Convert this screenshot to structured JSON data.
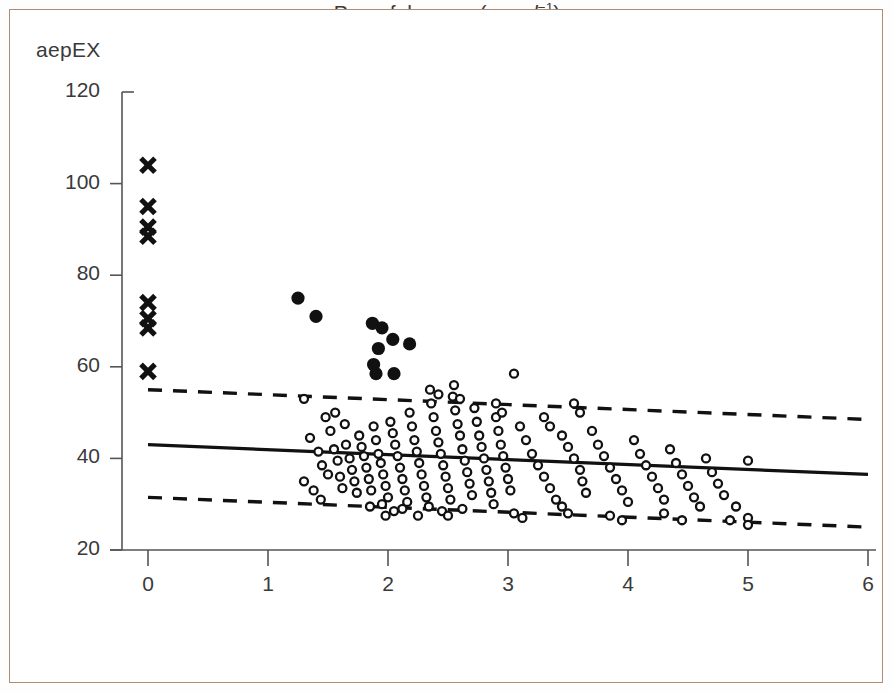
{
  "figure": {
    "border_color": "#b08b72",
    "background": "#ffffff",
    "ink_color": "#111111",
    "axis_color": "#555555"
  },
  "chart_data": {
    "type": "scatter",
    "title": "",
    "ylabel": "aepEX",
    "xlabel_prefix": "Propofol concn (",
    "xlabel_mu": "μg ml",
    "xlabel_sup": "−1",
    "xlabel_suffix": ")",
    "xlabel_plain": "Propofol concn (μg ml−1)",
    "xlim": [
      0,
      6
    ],
    "ylim": [
      20,
      120
    ],
    "xticks": [
      0,
      1,
      2,
      3,
      4,
      5,
      6
    ],
    "yticks": [
      20,
      40,
      60,
      80,
      100,
      120
    ],
    "xtick_labels": [
      "0",
      "1",
      "2",
      "3",
      "4",
      "5",
      "6"
    ],
    "ytick_labels": [
      "20",
      "40",
      "60",
      "80",
      "100",
      "120"
    ],
    "grid": false,
    "legend": "none",
    "series": [
      {
        "name": "awake (cross markers)",
        "marker": "x",
        "filled": true,
        "points": [
          [
            0,
            104
          ],
          [
            0,
            95
          ],
          [
            0,
            90.5
          ],
          [
            0,
            88.5
          ],
          [
            0,
            74
          ],
          [
            0,
            70.5
          ],
          [
            0,
            68.5
          ],
          [
            0,
            59
          ]
        ]
      },
      {
        "name": "responsive / transition (filled circles)",
        "marker": "o",
        "filled": true,
        "points": [
          [
            1.25,
            75
          ],
          [
            1.4,
            71
          ],
          [
            1.87,
            69.5
          ],
          [
            1.95,
            68.5
          ],
          [
            2.04,
            66
          ],
          [
            1.92,
            64
          ],
          [
            2.18,
            65
          ],
          [
            1.88,
            60.5
          ],
          [
            1.9,
            58.5
          ],
          [
            2.05,
            58.5
          ]
        ]
      },
      {
        "name": "anaesthetized (open circles)",
        "marker": "o",
        "filled": false,
        "points": [
          [
            1.3,
            53
          ],
          [
            1.35,
            44.5
          ],
          [
            1.42,
            41.5
          ],
          [
            1.45,
            38.5
          ],
          [
            1.5,
            36.5
          ],
          [
            1.55,
            42
          ],
          [
            1.58,
            39.5
          ],
          [
            1.6,
            36
          ],
          [
            1.62,
            33.5
          ],
          [
            1.65,
            43
          ],
          [
            1.68,
            40
          ],
          [
            1.7,
            37.5
          ],
          [
            1.72,
            35
          ],
          [
            1.74,
            32.5
          ],
          [
            1.76,
            45
          ],
          [
            1.78,
            42.5
          ],
          [
            1.8,
            40.5
          ],
          [
            1.82,
            38
          ],
          [
            1.84,
            35.5
          ],
          [
            1.86,
            33
          ],
          [
            1.88,
            47
          ],
          [
            1.9,
            44
          ],
          [
            1.92,
            41
          ],
          [
            1.94,
            39
          ],
          [
            1.96,
            36.5
          ],
          [
            1.98,
            34
          ],
          [
            2.0,
            31.5
          ],
          [
            2.02,
            48
          ],
          [
            2.04,
            45.5
          ],
          [
            2.06,
            43
          ],
          [
            2.08,
            40.5
          ],
          [
            2.1,
            38
          ],
          [
            2.12,
            35.5
          ],
          [
            2.14,
            33
          ],
          [
            2.16,
            30.5
          ],
          [
            2.18,
            50
          ],
          [
            2.2,
            47
          ],
          [
            2.22,
            44
          ],
          [
            2.24,
            41.5
          ],
          [
            2.26,
            39
          ],
          [
            2.28,
            36.5
          ],
          [
            2.3,
            34
          ],
          [
            2.32,
            31.5
          ],
          [
            2.34,
            29.5
          ],
          [
            2.36,
            52
          ],
          [
            2.38,
            49
          ],
          [
            2.4,
            46
          ],
          [
            2.42,
            43.5
          ],
          [
            2.44,
            41
          ],
          [
            2.46,
            38.5
          ],
          [
            2.48,
            36
          ],
          [
            2.5,
            33.5
          ],
          [
            2.52,
            31
          ],
          [
            2.54,
            53.5
          ],
          [
            2.56,
            50.5
          ],
          [
            2.58,
            47.5
          ],
          [
            2.6,
            45
          ],
          [
            2.62,
            42
          ],
          [
            2.64,
            39.5
          ],
          [
            2.66,
            37
          ],
          [
            2.68,
            34.5
          ],
          [
            2.7,
            32
          ],
          [
            2.72,
            51
          ],
          [
            2.74,
            48
          ],
          [
            2.76,
            45
          ],
          [
            2.78,
            42.5
          ],
          [
            2.8,
            40
          ],
          [
            2.82,
            37.5
          ],
          [
            2.84,
            35
          ],
          [
            2.86,
            32.5
          ],
          [
            2.88,
            30
          ],
          [
            2.9,
            49
          ],
          [
            2.92,
            46
          ],
          [
            2.94,
            43
          ],
          [
            2.96,
            40.5
          ],
          [
            2.98,
            38
          ],
          [
            3.0,
            35.5
          ],
          [
            3.02,
            33
          ],
          [
            3.05,
            58.5
          ],
          [
            3.1,
            47
          ],
          [
            3.15,
            44
          ],
          [
            3.2,
            41
          ],
          [
            3.25,
            38.5
          ],
          [
            3.3,
            36
          ],
          [
            3.35,
            33.5
          ],
          [
            3.4,
            31
          ],
          [
            3.45,
            45
          ],
          [
            3.5,
            42.5
          ],
          [
            3.55,
            40
          ],
          [
            3.6,
            37.5
          ],
          [
            3.62,
            35
          ],
          [
            3.65,
            32.5
          ],
          [
            3.7,
            46
          ],
          [
            3.75,
            43
          ],
          [
            3.8,
            40.5
          ],
          [
            3.85,
            38
          ],
          [
            3.9,
            35.5
          ],
          [
            3.95,
            33
          ],
          [
            4.0,
            30.5
          ],
          [
            4.05,
            44
          ],
          [
            4.1,
            41
          ],
          [
            4.15,
            38.5
          ],
          [
            4.2,
            36
          ],
          [
            4.25,
            33.5
          ],
          [
            4.3,
            31
          ],
          [
            4.35,
            42
          ],
          [
            4.4,
            39
          ],
          [
            4.45,
            36.5
          ],
          [
            4.5,
            34
          ],
          [
            4.55,
            31.5
          ],
          [
            4.6,
            29.5
          ],
          [
            4.65,
            40
          ],
          [
            4.7,
            37
          ],
          [
            4.75,
            34.5
          ],
          [
            4.8,
            32
          ],
          [
            4.9,
            29.5
          ],
          [
            5.0,
            39.5
          ],
          [
            5.0,
            27
          ],
          [
            5.0,
            25.5
          ],
          [
            4.85,
            26.5
          ],
          [
            1.48,
            49
          ],
          [
            1.52,
            46
          ],
          [
            1.56,
            50
          ],
          [
            1.64,
            47.5
          ],
          [
            1.3,
            35
          ],
          [
            1.38,
            33
          ],
          [
            1.44,
            31
          ],
          [
            2.42,
            54
          ],
          [
            2.55,
            56
          ],
          [
            2.6,
            53
          ],
          [
            2.35,
            55
          ],
          [
            3.55,
            52
          ],
          [
            3.6,
            50
          ],
          [
            3.3,
            49
          ],
          [
            3.35,
            47
          ],
          [
            2.9,
            52
          ],
          [
            2.95,
            50
          ],
          [
            2.45,
            28.5
          ],
          [
            2.5,
            27.5
          ],
          [
            2.62,
            29
          ],
          [
            3.05,
            28
          ],
          [
            3.12,
            27
          ],
          [
            3.45,
            29.5
          ],
          [
            3.5,
            28
          ],
          [
            3.85,
            27.5
          ],
          [
            3.95,
            26.5
          ],
          [
            4.3,
            28
          ],
          [
            4.45,
            26.5
          ],
          [
            1.95,
            30
          ],
          [
            2.05,
            28.5
          ],
          [
            1.98,
            27.5
          ],
          [
            2.12,
            29
          ],
          [
            2.25,
            27.5
          ],
          [
            1.85,
            29.5
          ]
        ]
      }
    ],
    "fit_lines": [
      {
        "name": "mean-regression",
        "style": "solid",
        "x": [
          0,
          6
        ],
        "y": [
          43,
          36.5
        ]
      },
      {
        "name": "upper-limit-of-agreement",
        "style": "dashed",
        "x": [
          0,
          6
        ],
        "y": [
          55,
          48.5
        ]
      },
      {
        "name": "lower-limit-of-agreement",
        "style": "dashed",
        "x": [
          0,
          6
        ],
        "y": [
          31.5,
          25
        ]
      }
    ]
  }
}
